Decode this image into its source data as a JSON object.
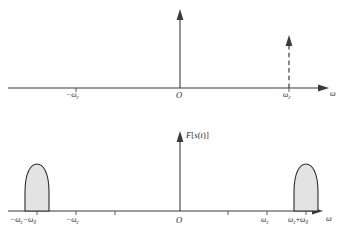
{
  "figure": {
    "background_color": "#ffffff",
    "line_color": "#3b3b3b",
    "lobe_fill_color": "#e3e3e3",
    "lobe_stroke_color": "#2b2b2b"
  },
  "top_panel": {
    "name": "carrier-spectrum",
    "axis_variable_label": "ω",
    "origin_label": "O",
    "ticks": [
      {
        "label_omega": "−ω",
        "label_sub": "c",
        "x": 76
      },
      {
        "label_omega": "ω",
        "label_sub": "c",
        "x": 289
      }
    ],
    "impulses": [
      {
        "name": "origin-impulse",
        "x": 180,
        "style": "solid",
        "top_y": 14
      },
      {
        "name": "carrier-impulse",
        "x": 289,
        "style": "dashed",
        "top_y": 40
      }
    ]
  },
  "bottom_panel": {
    "name": "modulated-spectrum",
    "y_axis_label_main": "F",
    "y_axis_label_brackets": "[s(t)]",
    "y_axis_label_full": "F[s(t)]",
    "axis_variable_label": "ω",
    "origin_label": "O",
    "ticks": [
      {
        "id": "neg-carrier-minus-mod",
        "x": 37
      },
      {
        "id": "neg-carrier",
        "x": 76
      },
      {
        "id": "unlabeled-left",
        "x": 115
      },
      {
        "id": "origin",
        "x": 180
      },
      {
        "id": "unlabeled-right",
        "x": 228
      },
      {
        "id": "carrier",
        "x": 267
      },
      {
        "id": "carrier-plus-mod",
        "x": 306
      }
    ],
    "labels": [
      {
        "id": "neg-carrier-minus-mod",
        "text": "−ωc−ω0",
        "x": 37
      },
      {
        "id": "neg-carrier",
        "text": "−ωc",
        "x": 76
      },
      {
        "id": "origin",
        "text": "O",
        "x": 180
      },
      {
        "id": "carrier",
        "text": "ωc",
        "x": 267
      },
      {
        "id": "carrier-plus-mod",
        "text": "ωc+ω0",
        "x": 306
      }
    ],
    "lobes": [
      {
        "id": "lower-sideband",
        "center_x": 37,
        "half_width": 12,
        "height": 42
      },
      {
        "id": "upper-sideband",
        "center_x": 306,
        "half_width": 12,
        "height": 42
      }
    ]
  }
}
